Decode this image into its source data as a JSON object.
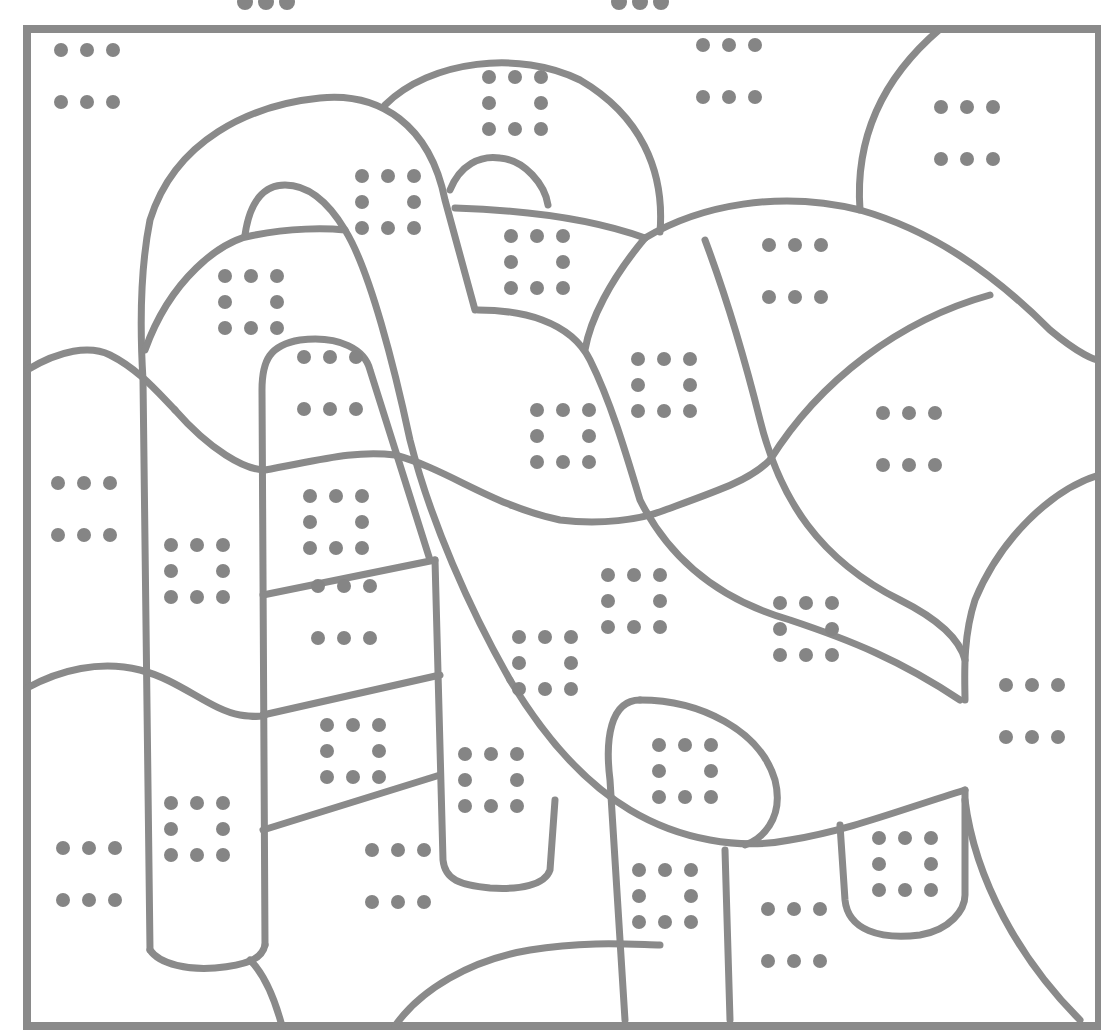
{
  "page": {
    "type": "color-by-dot-pattern coloring page",
    "colors": {
      "line": "#8a8a8a",
      "dot": "#858585",
      "background": "#ffffff"
    }
  },
  "header_markers": [
    {
      "pattern": "row3",
      "x": 266,
      "y": 2
    },
    {
      "pattern": "row3",
      "x": 640,
      "y": 2
    }
  ],
  "patterns": {
    "six": "two rows of three dots",
    "eight": "3x3 square of dots with center missing"
  },
  "regions": [
    {
      "pattern": "six",
      "x": 87,
      "y": 76
    },
    {
      "pattern": "eight",
      "x": 515,
      "y": 103
    },
    {
      "pattern": "six",
      "x": 729,
      "y": 71
    },
    {
      "pattern": "six",
      "x": 967,
      "y": 133
    },
    {
      "pattern": "eight",
      "x": 388,
      "y": 202
    },
    {
      "pattern": "eight",
      "x": 537,
      "y": 262
    },
    {
      "pattern": "eight",
      "x": 251,
      "y": 302
    },
    {
      "pattern": "six",
      "x": 795,
      "y": 271
    },
    {
      "pattern": "six",
      "x": 330,
      "y": 383
    },
    {
      "pattern": "eight",
      "x": 664,
      "y": 385
    },
    {
      "pattern": "eight",
      "x": 563,
      "y": 436
    },
    {
      "pattern": "six",
      "x": 909,
      "y": 439
    },
    {
      "pattern": "eight",
      "x": 336,
      "y": 522
    },
    {
      "pattern": "six",
      "x": 84,
      "y": 509
    },
    {
      "pattern": "eight",
      "x": 197,
      "y": 571
    },
    {
      "pattern": "eight",
      "x": 634,
      "y": 601
    },
    {
      "pattern": "eight",
      "x": 806,
      "y": 629
    },
    {
      "pattern": "six",
      "x": 344,
      "y": 612
    },
    {
      "pattern": "eight",
      "x": 545,
      "y": 663
    },
    {
      "pattern": "eight",
      "x": 353,
      "y": 751
    },
    {
      "pattern": "eight",
      "x": 491,
      "y": 780
    },
    {
      "pattern": "eight",
      "x": 685,
      "y": 771
    },
    {
      "pattern": "six",
      "x": 1032,
      "y": 711
    },
    {
      "pattern": "eight",
      "x": 197,
      "y": 829
    },
    {
      "pattern": "eight",
      "x": 905,
      "y": 864
    },
    {
      "pattern": "eight",
      "x": 665,
      "y": 896
    },
    {
      "pattern": "six",
      "x": 89,
      "y": 874
    },
    {
      "pattern": "six",
      "x": 398,
      "y": 876
    },
    {
      "pattern": "six",
      "x": 794,
      "y": 935
    }
  ]
}
